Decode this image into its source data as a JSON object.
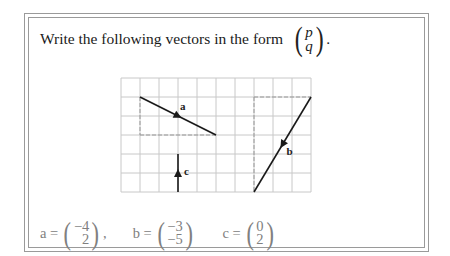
{
  "question": {
    "text": "Write the following vectors in the form",
    "form_vector": {
      "top": "p",
      "bottom": "q"
    },
    "end_punct": "."
  },
  "grid": {
    "cols": 10,
    "rows": 6,
    "cell_px": 19,
    "origin_px": [
      121,
      78
    ],
    "grid_color": "#c8c8c8",
    "line_color": "#1a1a1a",
    "helper_color": "#999999"
  },
  "vectors": [
    {
      "name": "a",
      "label": "a",
      "from": [
        1,
        1
      ],
      "to": [
        5,
        3
      ],
      "arrow_at": 0.5,
      "answer": {
        "top": "−4",
        "bottom": "2"
      },
      "separator": ","
    },
    {
      "name": "b",
      "label": "b",
      "from": [
        10,
        1
      ],
      "to": [
        7,
        6
      ],
      "arrow_at": 0.5,
      "answer": {
        "top": "−3",
        "bottom": "−5"
      },
      "separator": ""
    },
    {
      "name": "c",
      "label": "c",
      "from": [
        3,
        6
      ],
      "to": [
        3,
        4
      ],
      "arrow_at": 0.5,
      "answer": {
        "top": "0",
        "bottom": "2"
      },
      "separator": ""
    }
  ],
  "answers": {
    "text_color": "#808080",
    "a_label": "a =",
    "b_label": "b =",
    "c_label": "c ="
  }
}
